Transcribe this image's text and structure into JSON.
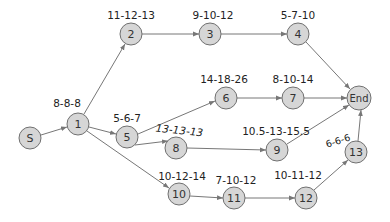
{
  "diagram": {
    "type": "network",
    "title": "",
    "nodes": [
      {
        "id": "S",
        "label": "S",
        "x": 30,
        "y": 138,
        "r": 11,
        "estimate": ""
      },
      {
        "id": "1",
        "label": "1",
        "x": 78,
        "y": 124,
        "r": 11,
        "estimate": "8-8-8"
      },
      {
        "id": "2",
        "label": "2",
        "x": 131,
        "y": 34,
        "r": 11,
        "estimate": "11-12-13"
      },
      {
        "id": "3",
        "label": "3",
        "x": 210,
        "y": 34,
        "r": 11,
        "estimate": "9-10-12"
      },
      {
        "id": "4",
        "label": "4",
        "x": 298,
        "y": 34,
        "r": 11,
        "estimate": "5-7-10"
      },
      {
        "id": "5",
        "label": "5",
        "x": 127,
        "y": 137,
        "r": 11,
        "estimate": "5-6-7"
      },
      {
        "id": "6",
        "label": "6",
        "x": 226,
        "y": 98,
        "r": 11,
        "estimate": "14-18-26"
      },
      {
        "id": "7",
        "label": "7",
        "x": 293,
        "y": 98,
        "r": 11,
        "estimate": "8-10-14"
      },
      {
        "id": "8",
        "label": "8",
        "x": 176,
        "y": 148,
        "r": 11,
        "estimate": "13-13-13"
      },
      {
        "id": "End",
        "label": "End",
        "x": 359,
        "y": 98,
        "r": 12,
        "estimate": ""
      },
      {
        "id": "9",
        "label": "9",
        "x": 277,
        "y": 150,
        "r": 11,
        "estimate": "10.5-13-15.5"
      },
      {
        "id": "10",
        "label": "10",
        "x": 179,
        "y": 194,
        "r": 11,
        "estimate": "10-12-14"
      },
      {
        "id": "11",
        "label": "11",
        "x": 234,
        "y": 198,
        "r": 11,
        "estimate": "7-10-12"
      },
      {
        "id": "12",
        "label": "12",
        "x": 306,
        "y": 198,
        "r": 11,
        "estimate": "10-11-12"
      },
      {
        "id": "13",
        "label": "13",
        "x": 356,
        "y": 152,
        "r": 11,
        "estimate": "6-6-6"
      }
    ],
    "edges": [
      [
        "S",
        "1"
      ],
      [
        "1",
        "2"
      ],
      [
        "1",
        "5"
      ],
      [
        "1",
        "10"
      ],
      [
        "2",
        "3"
      ],
      [
        "3",
        "4"
      ],
      [
        "4",
        "End"
      ],
      [
        "5",
        "6"
      ],
      [
        "6",
        "7"
      ],
      [
        "7",
        "End"
      ],
      [
        "5",
        "8"
      ],
      [
        "8",
        "9"
      ],
      [
        "9",
        "End"
      ],
      [
        "10",
        "11"
      ],
      [
        "11",
        "12"
      ],
      [
        "12",
        "13"
      ],
      [
        "13",
        "End"
      ]
    ],
    "labels": {
      "n1": "8-8-8",
      "n2": "11-12-13",
      "n3": "9-10-12",
      "n4": "5-7-10",
      "n5": "5-6-7",
      "n6": "14-18-26",
      "n7": "8-10-14",
      "n8": "13-13-13",
      "n9": "10.5-13-15.5",
      "n10": "10-12-14",
      "n11": "7-10-12",
      "n12": "10-11-12",
      "n13": "6-6-6",
      "S": "S",
      "1": "1",
      "2": "2",
      "3": "3",
      "4": "4",
      "5": "5",
      "6": "6",
      "7": "7",
      "8": "8",
      "9": "9",
      "10": "10",
      "11": "11",
      "12": "12",
      "13": "13",
      "End": "End"
    },
    "colors": {
      "node_fill": "#d6d6d6",
      "node_stroke": "#707070",
      "edge": "#777777",
      "text": "#222222"
    }
  }
}
